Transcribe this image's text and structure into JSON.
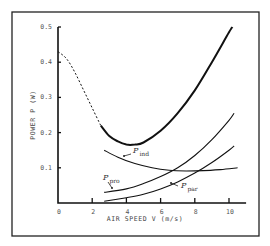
{
  "chart_data": {
    "type": "line",
    "title": "",
    "xlabel": "AIR SPEED  V  (m/s)",
    "ylabel": "POWER  P  (W)",
    "xlim": [
      0,
      11
    ],
    "ylim": [
      0,
      0.5
    ],
    "x_ticks": [
      0,
      2,
      4,
      6,
      8,
      10
    ],
    "x_tick_labels": [
      "0",
      "2",
      "4",
      "6",
      "8",
      "10"
    ],
    "y_ticks": [
      0.1,
      0.2,
      0.3,
      0.4,
      0.5
    ],
    "y_tick_labels": [
      "0.1",
      "0.2",
      "0.3",
      "0.4",
      "0.5"
    ],
    "grid": false,
    "legend": "inline labels with leader arrows",
    "series": [
      {
        "name": "P (total)",
        "style": "thick; dashed for V < 2.5, solid otherwise",
        "x": [
          0,
          0.5,
          1,
          1.5,
          2,
          2.5,
          3,
          3.5,
          4,
          4.5,
          5,
          6,
          7,
          8,
          9,
          10,
          10.2
        ],
        "values": [
          0.43,
          0.41,
          0.37,
          0.32,
          0.27,
          0.22,
          0.19,
          0.175,
          0.166,
          0.166,
          0.172,
          0.205,
          0.255,
          0.32,
          0.4,
          0.485,
          0.5
        ]
      },
      {
        "name": "P_ind",
        "label": "P",
        "subscript": "ind",
        "x": [
          2.7,
          3.5,
          4.5,
          5.5,
          6.5,
          7.5,
          8.5,
          9.5,
          10.5
        ],
        "values": [
          0.15,
          0.13,
          0.112,
          0.1,
          0.093,
          0.091,
          0.092,
          0.095,
          0.1
        ]
      },
      {
        "name": "P_pro",
        "label": "P",
        "subscript": "pro",
        "x": [
          2.7,
          4,
          5,
          6,
          7,
          8,
          9,
          10,
          10.3
        ],
        "values": [
          0.03,
          0.04,
          0.055,
          0.075,
          0.1,
          0.135,
          0.18,
          0.235,
          0.255
        ]
      },
      {
        "name": "P_par",
        "label": "P",
        "subscript": "par",
        "x": [
          2.7,
          4,
          5,
          6,
          7,
          8,
          9,
          10,
          10.3
        ],
        "values": [
          0.005,
          0.015,
          0.025,
          0.04,
          0.06,
          0.085,
          0.115,
          0.15,
          0.162
        ]
      }
    ]
  }
}
